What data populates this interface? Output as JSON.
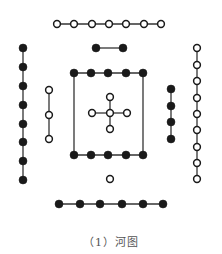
{
  "title": "河图",
  "caption": "（1）河图",
  "colors": {
    "ink": "#1a1a1a",
    "line": "#333333",
    "yin_fill": "#1a1a1a",
    "yang_fill": "#ffffff",
    "caption": "#555555"
  },
  "dot_radius": 4,
  "groups": [
    {
      "id": "top-7-yang",
      "count": 7,
      "type": "yang",
      "orientation": "horizontal",
      "points": [
        [
          57,
          24
        ],
        [
          74,
          24
        ],
        [
          92,
          24
        ],
        [
          109,
          24
        ],
        [
          126,
          24
        ],
        [
          144,
          24
        ],
        [
          161,
          24
        ]
      ]
    },
    {
      "id": "top-2-yin",
      "count": 2,
      "type": "yin",
      "orientation": "horizontal",
      "points": [
        [
          96,
          48
        ],
        [
          123,
          48
        ]
      ]
    },
    {
      "id": "left-8-yin",
      "count": 8,
      "type": "yin",
      "orientation": "vertical",
      "points": [
        [
          23,
          48
        ],
        [
          23,
          67
        ],
        [
          23,
          86
        ],
        [
          23,
          105
        ],
        [
          23,
          124
        ],
        [
          23,
          142
        ],
        [
          23,
          161
        ],
        [
          23,
          180
        ]
      ]
    },
    {
      "id": "left-3-yang",
      "count": 3,
      "type": "yang",
      "orientation": "vertical",
      "points": [
        [
          49,
          90
        ],
        [
          49,
          115
        ],
        [
          49,
          139
        ]
      ]
    },
    {
      "id": "right-4-yin",
      "count": 4,
      "type": "yin",
      "orientation": "vertical",
      "points": [
        [
          171,
          89
        ],
        [
          171,
          106
        ],
        [
          171,
          122
        ],
        [
          171,
          139
        ]
      ]
    },
    {
      "id": "right-9-yang",
      "count": 9,
      "type": "yang",
      "orientation": "vertical",
      "points": [
        [
          197,
          48
        ],
        [
          197,
          65
        ],
        [
          197,
          81
        ],
        [
          197,
          98
        ],
        [
          197,
          114
        ],
        [
          197,
          130
        ],
        [
          197,
          147
        ],
        [
          197,
          163
        ],
        [
          197,
          179
        ]
      ]
    },
    {
      "id": "center-square-top-5-yin",
      "count": 5,
      "type": "yin",
      "orientation": "horizontal",
      "points": [
        [
          74,
          73
        ],
        [
          91,
          73
        ],
        [
          108,
          73
        ],
        [
          126,
          73
        ],
        [
          143,
          73
        ]
      ]
    },
    {
      "id": "center-square-bottom-5-yin",
      "count": 5,
      "type": "yin",
      "orientation": "horizontal",
      "points": [
        [
          74,
          155
        ],
        [
          91,
          155
        ],
        [
          108,
          155
        ],
        [
          126,
          155
        ],
        [
          143,
          155
        ]
      ]
    },
    {
      "id": "center-cross-5-yang",
      "count": 5,
      "type": "yang",
      "orientation": "cross",
      "points": [
        [
          110,
          113
        ],
        [
          110,
          97
        ],
        [
          110,
          129
        ],
        [
          92,
          113
        ],
        [
          127,
          113
        ]
      ]
    },
    {
      "id": "bottom-1-yang",
      "count": 1,
      "type": "yang",
      "orientation": "single",
      "points": [
        [
          110,
          179
        ]
      ]
    },
    {
      "id": "bottom-6-yin",
      "count": 6,
      "type": "yin",
      "orientation": "horizontal",
      "points": [
        [
          59,
          204
        ],
        [
          80,
          204
        ],
        [
          100,
          204
        ],
        [
          122,
          204
        ],
        [
          143,
          204
        ],
        [
          163,
          204
        ]
      ]
    }
  ],
  "square": {
    "x1": 74,
    "y1": 73,
    "x2": 143,
    "y2": 155
  }
}
